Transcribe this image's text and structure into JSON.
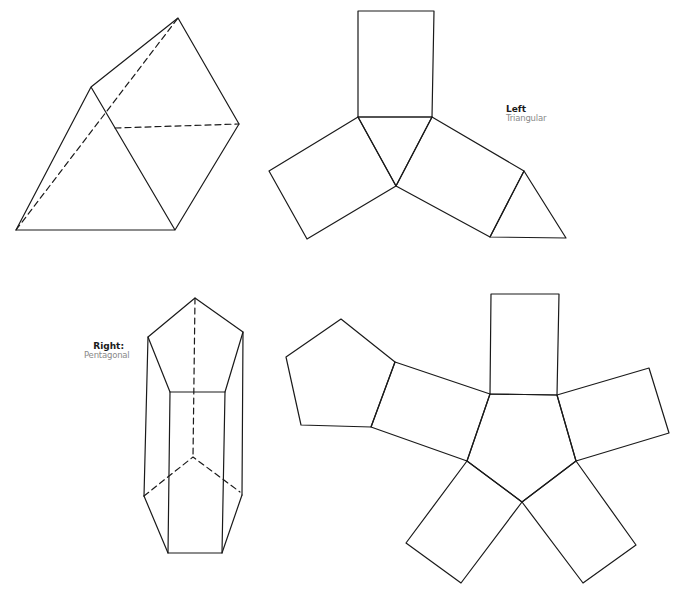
{
  "labels": {
    "left": {
      "title": "Left",
      "subtitle": "Triangular"
    },
    "right": {
      "title": "Right:",
      "subtitle": "Pentagonal"
    }
  },
  "figures": [
    {
      "id": "triangular-prism-3d",
      "description": "3D triangular prism with hidden edges dashed"
    },
    {
      "id": "triangular-prism-net",
      "description": "Net of triangular prism: 3 rectangles and 2 triangles"
    },
    {
      "id": "pentagonal-prism-3d",
      "description": "3D pentagonal prism with hidden edges dashed"
    },
    {
      "id": "pentagonal-prism-net",
      "description": "Net of pentagonal prism: 5 rectangles and 2 pentagons"
    }
  ],
  "colors": {
    "stroke": "#1a1a1a",
    "background": "#ffffff"
  }
}
